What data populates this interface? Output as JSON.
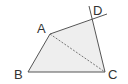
{
  "diagram": {
    "type": "geometry",
    "points": {
      "A": {
        "label": "A",
        "x": 50,
        "y": 34
      },
      "B": {
        "label": "B",
        "x": 28,
        "y": 72
      },
      "C": {
        "label": "C",
        "x": 105,
        "y": 72
      },
      "D": {
        "label": "D",
        "x": 92,
        "y": 20
      }
    },
    "fill_color": "#eeeeee",
    "line_color": "#555555",
    "segments": [
      "AB",
      "BC",
      "CD",
      "AD (extended)"
    ],
    "dashed_segments": [
      "AC"
    ]
  }
}
